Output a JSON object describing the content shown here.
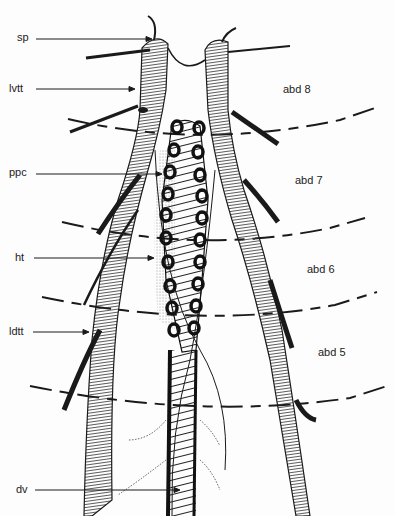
{
  "figure": {
    "type": "anatomical line drawing",
    "background": "#fdfdfd",
    "ink": "#1a1a1a"
  },
  "labels": {
    "left": [
      {
        "id": "sp",
        "text": "sp",
        "x": 9,
        "y": 35,
        "arrow_to": [
          152,
          39
        ]
      },
      {
        "id": "lvtt",
        "text": "lvtt",
        "x": 9,
        "y": 84,
        "arrow_to": [
          135,
          89
        ]
      },
      {
        "id": "ppc",
        "text": "ppc",
        "x": 9,
        "y": 168,
        "arrow_to": [
          162,
          174
        ]
      },
      {
        "id": "ht",
        "text": "ht",
        "x": 15,
        "y": 253,
        "arrow_to": [
          154,
          258
        ]
      },
      {
        "id": "ldtt",
        "text": "ldtt",
        "x": 9,
        "y": 324,
        "arrow_to": [
          89,
          332
        ]
      },
      {
        "id": "dv",
        "text": "dv",
        "x": 16,
        "y": 485,
        "arrow_to": [
          180,
          490
        ]
      }
    ],
    "segments": [
      {
        "id": "abd8",
        "text": "abd 8",
        "x": 283,
        "y": 84
      },
      {
        "id": "abd7",
        "text": "abd 7",
        "x": 295,
        "y": 175
      },
      {
        "id": "abd6",
        "text": "abd 6",
        "x": 307,
        "y": 264
      },
      {
        "id": "abd5",
        "text": "abd 5",
        "x": 318,
        "y": 347
      }
    ]
  }
}
